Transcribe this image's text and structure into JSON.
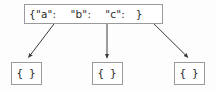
{
  "diagram": {
    "background_color": "#fdfdfd",
    "node_fill_color": "#ffffff",
    "node_border_color": "#9a9a9a",
    "edge_color": "#3a3a3a",
    "text_color": "#2b2b2b",
    "root": {
      "label": "{\"a\":    \"b\":    \"c\":   }",
      "keys": [
        "a",
        "b",
        "c"
      ]
    },
    "leaves": [
      {
        "label": "{ }"
      },
      {
        "label": "{ }"
      },
      {
        "label": "{ }"
      }
    ],
    "edges": [
      {
        "from": "a",
        "to": "leaf-0",
        "x1": 57,
        "y1": 20,
        "x2": 27,
        "y2": 59
      },
      {
        "from": "b",
        "to": "leaf-1",
        "x1": 107,
        "y1": 20,
        "x2": 107,
        "y2": 59
      },
      {
        "from": "c",
        "to": "leaf-2",
        "x1": 150,
        "y1": 20,
        "x2": 189,
        "y2": 59
      }
    ]
  }
}
